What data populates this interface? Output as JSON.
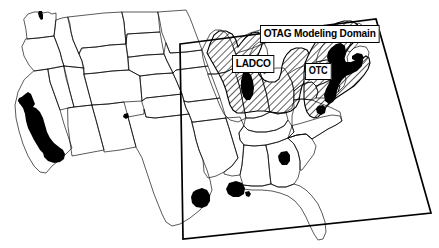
{
  "figure": {
    "type": "map",
    "region": "Continental United States",
    "title_visible": false,
    "background_color": "#ffffff",
    "outline_color": "#000000",
    "fill_color": "#ffffff",
    "nonattainment_fill": "#000000",
    "hatch_color": "#000000"
  },
  "labels": {
    "domain": "OTAG Modeling Domain",
    "ladco": "LADCO",
    "otc": "OTC"
  },
  "overlays": {
    "modeling_domain": {
      "name": "OTAG Modeling Domain",
      "style": "solid black quadrilateral outline",
      "corners": [
        {
          "x": 180,
          "y": 44
        },
        {
          "x": 376,
          "y": 19
        },
        {
          "x": 431,
          "y": 213
        },
        {
          "x": 183,
          "y": 239
        }
      ]
    },
    "ladco_region": {
      "name": "LADCO",
      "style": "diagonal hatch",
      "states": [
        "Wisconsin",
        "Michigan",
        "Illinois",
        "Indiana",
        "Ohio"
      ]
    },
    "otc_region": {
      "name": "OTC",
      "style": "diagonal hatch",
      "states": [
        "Maine",
        "New Hampshire",
        "Vermont",
        "Massachusetts",
        "Rhode Island",
        "Connecticut",
        "New York",
        "New Jersey",
        "Pennsylvania",
        "Delaware",
        "Maryland",
        "District of Columbia",
        "Northern Virginia"
      ]
    }
  },
  "nonattainment_areas": [
    {
      "name": "Seattle",
      "state": "Washington"
    },
    {
      "name": "Central Valley / Los Angeles",
      "state": "California"
    },
    {
      "name": "El Paso",
      "state": "Texas"
    },
    {
      "name": "Houston",
      "state": "Texas"
    },
    {
      "name": "Baton Rouge / New Orleans",
      "state": "Louisiana"
    },
    {
      "name": "Atlanta",
      "state": "Georgia"
    },
    {
      "name": "Chicago / Lake Michigan",
      "state": "Illinois"
    },
    {
      "name": "Northeast Urban Corridor",
      "state": "New York / New Jersey / Pennsylvania / Maryland"
    }
  ]
}
